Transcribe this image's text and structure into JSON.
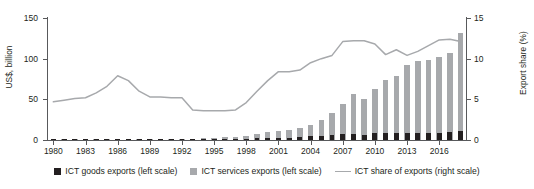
{
  "chart_data": {
    "type": "bar",
    "title": "",
    "subtitle": "",
    "xlabel": "",
    "ylabel": "US$, billion",
    "ylabel_right": "Export share (%)",
    "ylim": [
      0,
      150
    ],
    "ylim_right": [
      0,
      15
    ],
    "yticks": [
      0,
      50,
      100,
      150
    ],
    "yticks_right": [
      0,
      5,
      10,
      15
    ],
    "grid": false,
    "legend_position": "bottom",
    "x": [
      1980,
      1981,
      1982,
      1983,
      1984,
      1985,
      1986,
      1987,
      1988,
      1989,
      1990,
      1991,
      1992,
      1993,
      1994,
      1995,
      1996,
      1997,
      1998,
      1999,
      2000,
      2001,
      2002,
      2003,
      2004,
      2005,
      2006,
      2007,
      2008,
      2009,
      2010,
      2011,
      2012,
      2013,
      2014,
      2015,
      2016,
      2017,
      2018
    ],
    "xtick_labels": [
      "1980",
      "1983",
      "1986",
      "1989",
      "1992",
      "1995",
      "1998",
      "2001",
      "2004",
      "2007",
      "2010",
      "2013",
      "2016"
    ],
    "series": [
      {
        "name": "ICT goods exports (left scale)",
        "type": "bar",
        "axis": "left",
        "color": "#231f20",
        "values": [
          0.2,
          0.2,
          0.2,
          0.3,
          0.3,
          0.3,
          0.4,
          0.4,
          0.5,
          0.5,
          0.6,
          0.6,
          0.7,
          0.8,
          0.9,
          1.0,
          1.1,
          1.3,
          1.6,
          1.9,
          2.4,
          2.4,
          2.8,
          3.5,
          4.5,
          5.2,
          6.0,
          6.8,
          7.5,
          6.5,
          8.2,
          8.6,
          8.8,
          9.0,
          9.2,
          8.8,
          8.8,
          9.5,
          10.5
        ]
      },
      {
        "name": "ICT services exports (left scale)",
        "type": "bar",
        "axis": "left",
        "color": "#a7a9ac",
        "values": [
          0.3,
          0.3,
          0.4,
          0.4,
          0.5,
          0.5,
          0.6,
          0.7,
          0.8,
          0.9,
          1.0,
          1.2,
          1.4,
          1.7,
          2.0,
          2.5,
          3.2,
          4.0,
          5.5,
          7.5,
          9.5,
          10.5,
          12.0,
          15.0,
          19.0,
          25.0,
          33.0,
          44.0,
          56.0,
          51.0,
          63.0,
          74.0,
          79.0,
          92.0,
          97.0,
          98.5,
          102.0,
          107.0,
          132.0
        ]
      },
      {
        "name": "ICT share of exports (right scale)",
        "type": "line",
        "axis": "right",
        "color": "#a7a9ac",
        "values": [
          4.7,
          4.9,
          5.1,
          5.2,
          5.8,
          6.6,
          7.9,
          7.3,
          6.0,
          5.3,
          5.3,
          5.2,
          5.2,
          3.7,
          3.6,
          3.6,
          3.6,
          3.7,
          4.6,
          6.0,
          7.3,
          8.4,
          8.4,
          8.6,
          9.5,
          10.0,
          10.4,
          12.1,
          12.2,
          12.2,
          11.8,
          10.5,
          11.1,
          10.4,
          10.9,
          11.6,
          12.3,
          12.4,
          12.1
        ]
      }
    ]
  },
  "axes": {
    "left_title": "US$, billion",
    "right_title": "Export share (%)"
  },
  "legend": {
    "items": [
      {
        "label": "ICT goods exports (left scale)",
        "marker": "square-dark",
        "color": "#231f20"
      },
      {
        "label": "ICT services exports (left scale)",
        "marker": "square-gray",
        "color": "#a7a9ac"
      },
      {
        "label": "ICT share of exports (right scale)",
        "marker": "line-gray",
        "color": "#a7a9ac"
      }
    ]
  }
}
